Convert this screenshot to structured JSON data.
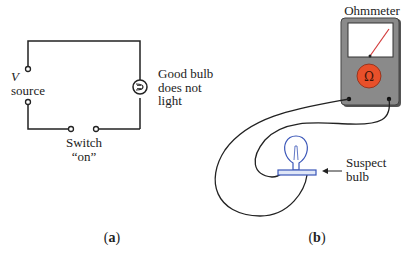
{
  "panel_a": {
    "caption_open": "(",
    "caption_letter": "a",
    "caption_close": ")",
    "source_symbol": "V",
    "source_label": "source",
    "bulb_label_1": "Good bulb",
    "bulb_label_2": "does not",
    "bulb_label_3": "light",
    "switch_label_1": "Switch",
    "switch_label_2": "“on”"
  },
  "panel_b": {
    "caption_open": "(",
    "caption_letter": "b",
    "caption_close": ")",
    "meter_title": "Ohmmeter",
    "meter_symbol": "Ω",
    "bulb_label_1": "Suspect",
    "bulb_label_2": "bulb"
  },
  "colors": {
    "meter_body": "#8a8a8a",
    "meter_knob": "#e8502a",
    "needle": "#d23a3a",
    "bulb_blue": "#3a56b8",
    "wire": "#222222"
  }
}
